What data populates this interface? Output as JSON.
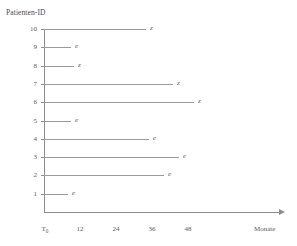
{
  "chart_data": {
    "type": "bar",
    "orientation": "horizontal",
    "title": "Patienten-ID",
    "ylabel": "Patienten-ID",
    "xlabel": "Monate",
    "xlim": [
      0,
      72
    ],
    "ylim": [
      1,
      10
    ],
    "grid": false,
    "legend": false,
    "x_tick_labels": [
      "T₀",
      "12",
      "24",
      "36",
      "48"
    ],
    "x_tick_values": [
      0,
      12,
      24,
      36,
      48
    ],
    "y_tick_labels": [
      "10",
      "9",
      "8",
      "7",
      "6",
      "5",
      "4",
      "3",
      "2",
      "1"
    ],
    "categories": [
      10,
      9,
      8,
      7,
      6,
      5,
      4,
      3,
      2,
      1
    ],
    "values": [
      34,
      9,
      10,
      43,
      50,
      9,
      35,
      45,
      40,
      8
    ],
    "markers": [
      "z",
      "e",
      "z",
      "z",
      "z",
      "e",
      "e",
      "e",
      "e",
      "e"
    ],
    "rows": [
      {
        "patient_id": "10",
        "months": 34,
        "marker": "z"
      },
      {
        "patient_id": "9",
        "months": 9,
        "marker": "e"
      },
      {
        "patient_id": "8",
        "months": 10,
        "marker": "z"
      },
      {
        "patient_id": "7",
        "months": 43,
        "marker": "z"
      },
      {
        "patient_id": "6",
        "months": 50,
        "marker": "z"
      },
      {
        "patient_id": "5",
        "months": 9,
        "marker": "e"
      },
      {
        "patient_id": "4",
        "months": 35,
        "marker": "e"
      },
      {
        "patient_id": "3",
        "months": 45,
        "marker": "e"
      },
      {
        "patient_id": "2",
        "months": 40,
        "marker": "e"
      },
      {
        "patient_id": "1",
        "months": 8,
        "marker": "e"
      }
    ]
  },
  "axis": {
    "y_title": "Patienten-ID",
    "x_unit": "Monate",
    "x_tick_0_letter": "T",
    "x_tick_0_sub": "0",
    "x_tick_12": "12",
    "x_tick_24": "24",
    "x_tick_36": "36",
    "x_tick_48": "48"
  },
  "colors": {
    "axis": "#8d8d8d",
    "bar": "#9a9a9a",
    "text": "#5a5a5a",
    "background": "#ffffff"
  }
}
